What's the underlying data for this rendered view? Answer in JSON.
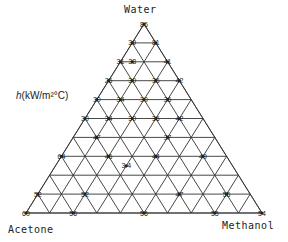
{
  "diagram": {
    "type": "ternary",
    "vertices": {
      "top": "Water",
      "bottom_left": "Acetone",
      "bottom_right": "Methanol"
    },
    "quantity_label_prefix": "h",
    "quantity_label_suffix": "(kW/m²°C)",
    "divisions": 10,
    "line_color": "#333333",
    "point_labels": [
      {
        "row": 0,
        "col": 0,
        "text": "86"
      },
      {
        "row": 1,
        "col": 0,
        "text": "39"
      },
      {
        "row": 1,
        "col": 1,
        "text": "81"
      },
      {
        "row": 2,
        "col": 0,
        "text": "31"
      },
      {
        "row": 2,
        "col": 0.5,
        "text": "38"
      },
      {
        "row": 2,
        "col": 2,
        "text": "41"
      },
      {
        "row": 3,
        "col": 0,
        "text": "26"
      },
      {
        "row": 3,
        "col": 1,
        "text": "30"
      },
      {
        "row": 3,
        "col": 2,
        "text": "36"
      },
      {
        "row": 3,
        "col": 3,
        "text": "42"
      },
      {
        "row": 4,
        "col": 0,
        "text": "30"
      },
      {
        "row": 4,
        "col": 1,
        "text": "34"
      },
      {
        "row": 4,
        "col": 2,
        "text": "30"
      },
      {
        "row": 4,
        "col": 3,
        "text": "36"
      },
      {
        "row": 5,
        "col": 0,
        "text": "30"
      },
      {
        "row": 5,
        "col": 1,
        "text": "34"
      },
      {
        "row": 5,
        "col": 2,
        "text": "30"
      },
      {
        "row": 5,
        "col": 3,
        "text": "36"
      },
      {
        "row": 5,
        "col": 4,
        "text": "42"
      },
      {
        "row": 6,
        "col": 1,
        "text": "47"
      },
      {
        "row": 6,
        "col": 4,
        "text": "37"
      },
      {
        "row": 7,
        "col": 0,
        "text": "64"
      },
      {
        "row": 7,
        "col": 2,
        "text": "46"
      },
      {
        "row": 7,
        "col": 4,
        "text": "44"
      },
      {
        "row": 7,
        "col": 6,
        "text": "49"
      },
      {
        "row": 7.5,
        "col": 3,
        "text": "3.4"
      },
      {
        "row": 9,
        "col": 0,
        "text": "52"
      },
      {
        "row": 9,
        "col": 2,
        "text": "52"
      },
      {
        "row": 9,
        "col": 6,
        "text": "47"
      },
      {
        "row": 9,
        "col": 8,
        "text": "55"
      },
      {
        "row": 10,
        "col": 0,
        "text": "60"
      },
      {
        "row": 10,
        "col": 2,
        "text": "56"
      },
      {
        "row": 10,
        "col": 5,
        "text": "56"
      },
      {
        "row": 10,
        "col": 8,
        "text": "55"
      },
      {
        "row": 10,
        "col": 10,
        "text": "54"
      }
    ]
  }
}
